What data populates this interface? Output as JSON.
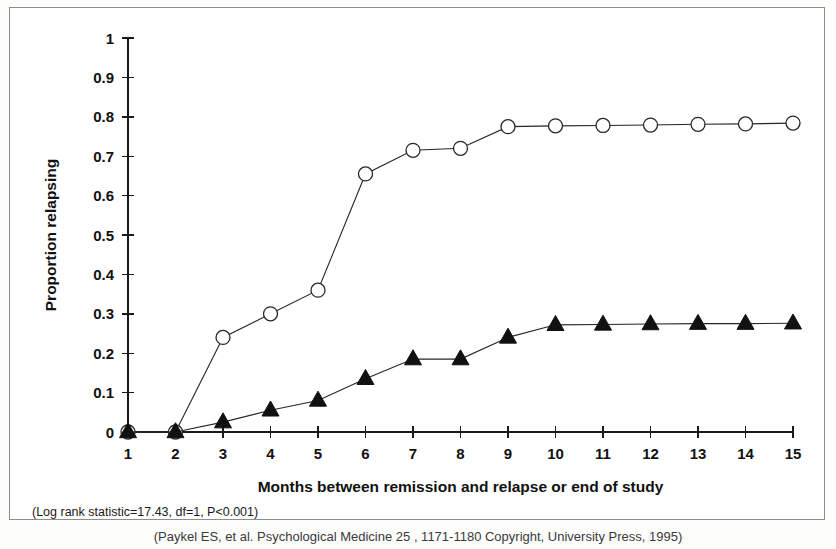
{
  "figure": {
    "caption": "(Paykel ES, et al. Psychological Medicine 25 , 1171-1180 Copyright, University Press, 1995)",
    "annotation": "(Log rank statistic=17.43, df=1, P<0.001)"
  },
  "chart_data": {
    "type": "line",
    "title": "",
    "xlabel": "Months between remission and relapse or end of study",
    "ylabel": "Proportion relapsing",
    "x": [
      1,
      2,
      3,
      4,
      5,
      6,
      7,
      8,
      9,
      10,
      11,
      12,
      13,
      14,
      15
    ],
    "xlim": [
      1,
      15
    ],
    "ylim": [
      0,
      1
    ],
    "xticks": [
      1,
      2,
      3,
      4,
      5,
      6,
      7,
      8,
      9,
      10,
      11,
      12,
      13,
      14,
      15
    ],
    "xtick_labels": [
      "1",
      "2",
      "3",
      "4",
      "5",
      "6",
      "7",
      "8",
      "9",
      "10",
      "11",
      "12",
      "13",
      "14",
      "15"
    ],
    "yticks": [
      0,
      0.1,
      0.2,
      0.3,
      0.4,
      0.5,
      0.6,
      0.7,
      0.8,
      0.9,
      1
    ],
    "ytick_labels": [
      "0",
      "0.1",
      "0.2",
      "0.3",
      "0.4",
      "0.5",
      "0.6",
      "0.7",
      "0.8",
      "0.9",
      "1"
    ],
    "grid": false,
    "legend": "none",
    "series": [
      {
        "name": "Clinical management alone",
        "marker": "open-circle",
        "color": "#262626",
        "values": [
          0,
          0,
          0.24,
          0.3,
          0.36,
          0.655,
          0.715,
          0.72,
          0.775,
          0.777,
          0.778,
          0.779,
          0.781,
          0.782,
          0.784
        ]
      },
      {
        "name": "Cognitive therapy plus clinical management",
        "marker": "filled-triangle",
        "color": "#111111",
        "values": [
          0,
          0,
          0.025,
          0.055,
          0.08,
          0.135,
          0.185,
          0.185,
          0.24,
          0.272,
          0.273,
          0.274,
          0.275,
          0.275,
          0.276
        ]
      }
    ]
  }
}
